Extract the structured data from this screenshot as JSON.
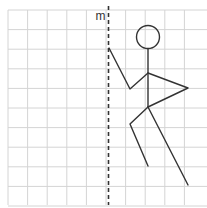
{
  "diagram": {
    "type": "grid-reflection",
    "grid": {
      "x0": 8,
      "y0": 10,
      "cell": 19.6,
      "cols": 10,
      "rows": 10,
      "right_edge": 207,
      "bottom_edge": 205,
      "color": "#d4d4d4"
    },
    "mirror_line": {
      "label": "m",
      "x": 108.5,
      "y1": 6,
      "y2": 205,
      "style": "dashed",
      "color": "#333333"
    },
    "stick_figure": {
      "color": "#333333",
      "head": {
        "cx": 148,
        "cy": 37,
        "r": 11.5
      },
      "neck": {
        "x": 148,
        "y": 49
      },
      "shoulder": {
        "x": 148,
        "y": 73
      },
      "hip": {
        "x": 148,
        "y": 107
      },
      "left_arm": {
        "elbow": {
          "x": 130,
          "y": 89
        },
        "hand": {
          "x": 109,
          "y": 48
        }
      },
      "right_arm": {
        "hand": {
          "x": 188,
          "y": 88
        }
      },
      "left_leg": {
        "knee": {
          "x": 130,
          "y": 124
        },
        "foot": {
          "x": 148,
          "y": 166
        }
      },
      "right_leg": {
        "foot": {
          "x": 188,
          "y": 185
        }
      }
    }
  }
}
